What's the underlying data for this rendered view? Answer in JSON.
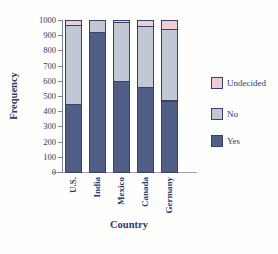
{
  "figure": {
    "background": "#fefefd",
    "text_color": "#2d3a66",
    "outline_color": "#39406b",
    "axis_color": "#7b8196"
  },
  "chart_data": {
    "type": "bar",
    "stacked": true,
    "xlabel": "Country",
    "ylabel": "Frequency",
    "categories": [
      "U.S.",
      "India",
      "Mexico",
      "Canada",
      "Germany"
    ],
    "series": [
      {
        "name": "Yes",
        "color": "#515f87",
        "values": [
          450,
          920,
          600,
          560,
          470
        ]
      },
      {
        "name": "No",
        "color": "#c1c7d3",
        "values": [
          520,
          80,
          390,
          400,
          470
        ]
      },
      {
        "name": "Undecided",
        "color": "#eeccd5",
        "values": [
          30,
          0,
          10,
          40,
          60
        ]
      }
    ],
    "ylim": [
      0,
      1000
    ],
    "y_ticks": [
      0,
      100,
      200,
      300,
      400,
      500,
      600,
      700,
      800,
      900,
      1000
    ],
    "legend": [
      "Undecided",
      "No",
      "Yes"
    ],
    "legend_position": "right",
    "grid": false
  }
}
